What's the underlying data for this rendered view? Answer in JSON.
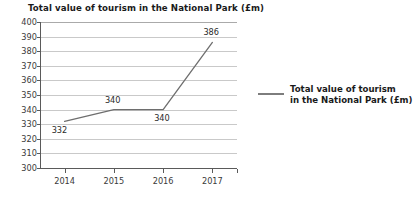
{
  "chart_data": {
    "type": "line",
    "title": "Total value of tourism in the National Park (£m)",
    "xlabel": "",
    "ylabel": "",
    "categories": [
      "2014",
      "2015",
      "2016",
      "2017"
    ],
    "values": [
      332,
      340,
      340,
      386
    ],
    "point_labels": [
      "332",
      "340",
      "340",
      "386"
    ],
    "series": [
      {
        "name": "Total value of tourism in the National Park (£m)",
        "values": [
          332,
          340,
          340,
          386
        ],
        "color": "#6e6e6e"
      }
    ],
    "ylim": [
      300,
      400
    ],
    "ytick_step": 10,
    "ytick_labels": [
      "400",
      "390",
      "380",
      "370",
      "360",
      "350",
      "340",
      "330",
      "320",
      "310",
      "300"
    ],
    "grid": true,
    "legend_position": "right",
    "legend": [
      {
        "label_line1": "Total value of tourism",
        "label_line2": "in the National Park (£m)",
        "color": "#7d7d7d"
      }
    ],
    "colors": {
      "line": "#6e6e6e",
      "grid": "#c9c9c9",
      "axis": "#5a5a5a",
      "text": "#2a2a2a",
      "background": "#ffffff"
    }
  }
}
